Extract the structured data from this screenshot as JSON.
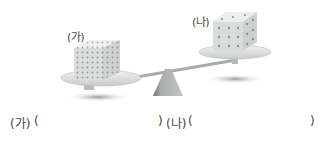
{
  "figure": {
    "left_label": "(가)",
    "right_label": "(나)",
    "left_cube": {
      "description": "dense small-dot cube",
      "dot_color": "#8a8f90"
    },
    "right_cube": {
      "description": "sparse dot cube",
      "dot_color": "#8a8f90"
    },
    "scale": "seesaw-balance tilted down on left"
  },
  "answers": {
    "left_prefix": "(가)",
    "left_open": "(",
    "left_close": ")",
    "right_prefix": "(나)",
    "right_open": "(",
    "right_close": ")"
  }
}
